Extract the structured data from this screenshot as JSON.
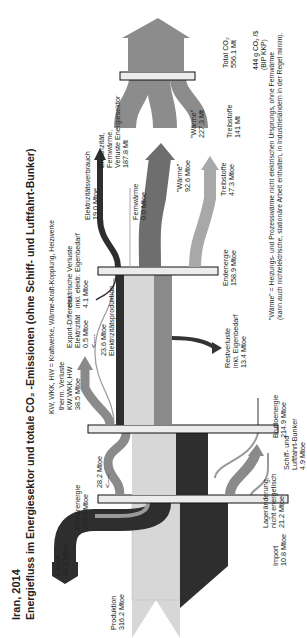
{
  "title": {
    "line1": "Iran, 2014",
    "line2": "Energiefluss im Energiesektor und totale CO₂ -Emissionen (ohne Schiff- und Luftfahrt-Bunker)"
  },
  "legend_abbrev": "KW, WKK, HW = Kraftwerke, Wärme-Kraft-Kopplung, Heizwerke",
  "nodes": {
    "produktion": {
      "label": "Produktion",
      "value": "316.2 Mtoe"
    },
    "export": {
      "label": "Export",
      "value": "86.2 Mtoe"
    },
    "primaerenergie": {
      "label": "Primärenergie",
      "value": "240.9 Mtoe"
    },
    "import": {
      "label": "Import",
      "value": "10.8 Mtoe"
    },
    "lageraenderung": {
      "line1": "Lageränderung,",
      "line2": "nicht energetisch",
      "value": "21.2 Mtoe"
    },
    "recycle": {
      "value": "28.2 Mtoe",
      "arrow": "<----"
    },
    "bruttoenergie": {
      "label": "Bruttoenergie",
      "value": "214.9 Mtoe"
    },
    "bunker": {
      "line1": "Schiff- und",
      "line2": "Luftfahrt-Bunker",
      "value": "4.9 Mtoe"
    },
    "therm_verluste": {
      "line1": "therm. Verluste",
      "line2": "KW,WKK,HW",
      "value": "38.5 Mtoe"
    },
    "export_diff": {
      "line1": "Export-Differenz",
      "line2": "Elektrizität",
      "value": "0.5 Mtoe",
      "arrow": "<----"
    },
    "elektrizitaetsproduktion": {
      "value": "23.6 Mtoe",
      "label": "Elektrizitätsproduktion"
    },
    "elektr_verluste": {
      "line1": "elektrische Verluste",
      "line2": "inkl. elektr. Eigenbedarf",
      "value": "4.1 Mtoe"
    },
    "restverluste": {
      "line1": "Restverluste",
      "line2": "inkl. Eigenbedarf",
      "value": "13.4 Mtoe"
    },
    "endenergie": {
      "label": "Endenergie",
      "value": "158.9 Mtoe"
    },
    "elektrizitaetsverbrauch": {
      "label": "Elektrizitätsverbrauch",
      "value": "19.0 Mtoe"
    },
    "fernwaerme": {
      "label": "Fernwärme",
      "value": "0.0 Mtoe"
    },
    "waerme": {
      "label": "\"Wärme\"",
      "value": "92.6 Mtoe"
    },
    "treibstoffe": {
      "label": "Treibstoffe",
      "value": "47.3 Mtoe"
    }
  },
  "co2": {
    "sektor": {
      "line1": "Elektrizität,",
      "line2": "Fernwärme,",
      "line3": "Verluste Energiesektor",
      "value": "187.8 Mt"
    },
    "waerme": {
      "label": "\"Wärme\"",
      "value": "227.3 Mt"
    },
    "treibstoffe": {
      "label": "Treibstoffe",
      "value": "141 Mt"
    },
    "total": {
      "label": "Total CO₂",
      "value": "556.1 Mt"
    },
    "intensity": {
      "value": "444 g CO₂ /$",
      "label": "(BIP KKP)"
    }
  },
  "footnote": {
    "line1": "\"Wärme\" = Heizungs- und Prozesswärme nicht elektrischen Ursprungs, ohne Fernwärme",
    "line2": "(kann auch nichtelektrische, stationäre Arbeit enthalten, in Industrieländern in der Regel minim)."
  },
  "colors": {
    "oil_light": "#d9d9d9",
    "gas_dark": "#2b2b2b",
    "mid_gray": "#8a8a8a",
    "co2_gray": "#8c8c8c",
    "bar_fill": "#ececec",
    "bar_stroke": "#111111"
  }
}
